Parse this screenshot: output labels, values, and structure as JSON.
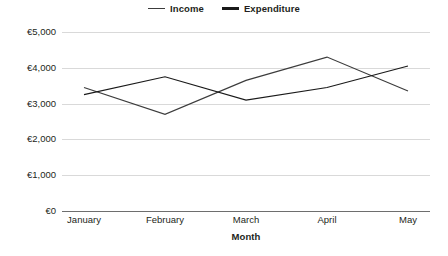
{
  "chart_data": {
    "type": "line",
    "title": "",
    "xlabel": "Month",
    "ylabel": "",
    "categories": [
      "January",
      "February",
      "March",
      "April",
      "May"
    ],
    "series": [
      {
        "name": "Income",
        "values": [
          3450,
          2700,
          3650,
          4300,
          3350
        ]
      },
      {
        "name": "Expenditure",
        "values": [
          3250,
          3750,
          3100,
          3450,
          4050
        ]
      }
    ],
    "ylim": [
      0,
      5000
    ],
    "ytick_values": [
      0,
      1000,
      2000,
      3000,
      4000,
      5000
    ],
    "ytick_labels": [
      "€0",
      "€1,000",
      "€2,000",
      "€3,000",
      "€4,000",
      "€5,000"
    ],
    "grid": true,
    "legend_position": "top-center",
    "currency_symbol": "€"
  },
  "legend": {
    "items": [
      {
        "label": "Income",
        "style": "thin",
        "color": "#3c3c3c"
      },
      {
        "label": "Expenditure",
        "style": "thick",
        "color": "#1a1a1a"
      }
    ]
  },
  "axis": {
    "x_title": "Month"
  },
  "colors": {
    "income_line": "#3c3c3c",
    "expenditure_line": "#1a1a1a",
    "gridline": "#d9d9d9",
    "axis": "#6e6e6e",
    "text": "#231f20",
    "background": "#ffffff"
  }
}
